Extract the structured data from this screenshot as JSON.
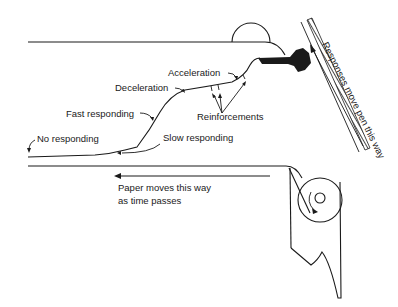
{
  "diagram": {
    "type": "cumulative-recorder",
    "labels": {
      "acceleration": "Acceleration",
      "deceleration": "Deceleration",
      "fast_responding": "Fast responding",
      "no_responding": "No responding",
      "slow_responding": "Slow responding",
      "reinforcements": "Reinforcements",
      "responses_move_pen": "Responses move pen this way",
      "paper_moves_line1": "Paper moves this way",
      "paper_moves_line2": "as time passes"
    },
    "colors": {
      "ink": "#1a1a1a",
      "background": "#ffffff"
    }
  }
}
